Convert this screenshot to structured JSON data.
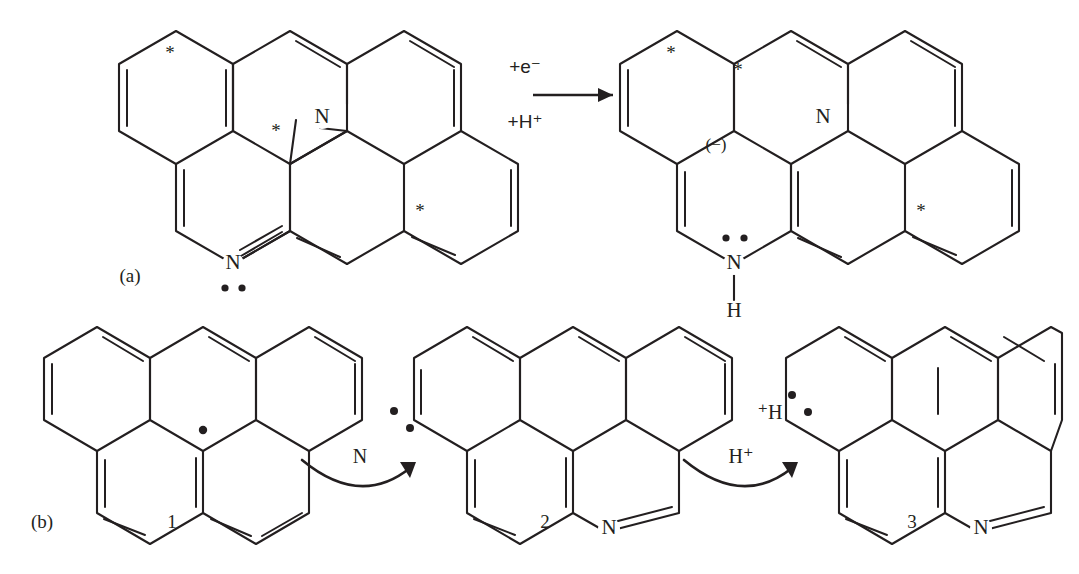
{
  "figure": {
    "type": "reaction-scheme",
    "background": "#ffffff",
    "ink_color": "#231f20"
  },
  "panels": [
    {
      "id": "a",
      "label": "(a)",
      "label_pos": [
        128,
        277
      ],
      "reaction_arrow": {
        "name": "reaction-arrow",
        "above_label": "+e⁻",
        "below_label": "+H⁺",
        "x1": 487,
        "x2": 573,
        "y": 95
      },
      "reactant": {
        "name": "structure-a-reactant",
        "atom_labels": [
          {
            "text": "N",
            "x": 307,
            "y": 118
          },
          {
            "text": "N",
            "x": 222,
            "y": 216
          }
        ],
        "star_labels": [
          {
            "text": "*",
            "x": 167,
            "y": 47
          },
          {
            "text": "*",
            "x": 268,
            "y": 128
          },
          {
            "text": "*",
            "x": 413,
            "y": 210
          }
        ],
        "lone_pairs": [
          {
            "x": 214,
            "y": 245
          },
          {
            "x": 230,
            "y": 245
          }
        ]
      },
      "product": {
        "name": "structure-a-product",
        "atom_labels": [
          {
            "text": "N",
            "x": 810,
            "y": 118
          },
          {
            "text": "N",
            "x": 714,
            "y": 228
          },
          {
            "text": "H",
            "x": 714,
            "y": 277
          }
        ],
        "star_labels": [
          {
            "text": "*",
            "x": 661,
            "y": 47
          },
          {
            "text": "*",
            "x": 727,
            "y": 65
          },
          {
            "text": "*",
            "x": 910,
            "y": 210
          }
        ],
        "charge_label": {
          "text": "(−)",
          "x": 712,
          "y": 143
        },
        "lone_pairs": [
          {
            "x": 706,
            "y": 203
          },
          {
            "x": 724,
            "y": 203
          }
        ]
      }
    },
    {
      "id": "b",
      "label": "(b)",
      "label_pos": [
        40,
        523
      ],
      "structures": [
        {
          "name": "structure-1",
          "number": "1",
          "number_pos": [
            170,
            523
          ]
        },
        {
          "name": "structure-2",
          "number": "2",
          "number_pos": [
            545,
            523
          ]
        },
        {
          "name": "structure-3",
          "number": "3",
          "number_pos": [
            912,
            523
          ]
        }
      ],
      "curved_arrows": [
        {
          "name": "curved-arrow-n",
          "label": "N",
          "label_pos": [
            359,
            455
          ],
          "from": [
            305,
            470
          ],
          "to": [
            418,
            460
          ]
        },
        {
          "name": "curved-arrow-hplus",
          "label": "H⁺",
          "label_pos": [
            740,
            455
          ],
          "from": [
            686,
            470
          ],
          "to": [
            800,
            460
          ]
        }
      ],
      "structure_1": {
        "radical_dot": {
          "x": 203,
          "y": 430
        },
        "atom_labels": []
      },
      "structure_2": {
        "atom_labels": [
          {
            "text": "N",
            "x": 588,
            "y": 516
          }
        ],
        "lone_pairs": [
          {
            "x": 394,
            "y": 411
          },
          {
            "x": 408,
            "y": 427
          }
        ]
      },
      "structure_3": {
        "atom_labels": [
          {
            "text": "N",
            "x": 957,
            "y": 516
          }
        ],
        "proton_label": {
          "text": "⁺H",
          "x": 768,
          "y": 413
        },
        "lone_pairs": [
          {
            "x": 790,
            "y": 396
          },
          {
            "x": 805,
            "y": 412
          }
        ]
      }
    }
  ],
  "text_items": {
    "panel_a_label": "(a)",
    "panel_b_label": "(b)",
    "electron_label": "+e⁻",
    "proton_label": "+H⁺",
    "nitrogen_symbol": "N",
    "hydrogen_symbol": "H",
    "anion_symbol": "(−)",
    "star_symbol": "*",
    "reagent_n": "N",
    "reagent_h_plus": "H⁺",
    "proton_prefix": "⁺H",
    "num_1": "1",
    "num_2": "2",
    "num_3": "3"
  }
}
